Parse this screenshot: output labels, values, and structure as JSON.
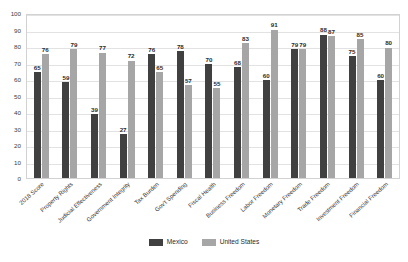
{
  "chart_data": {
    "type": "bar",
    "title": "",
    "subtitle": "",
    "xlabel": "",
    "ylabel": "",
    "ylim": [
      0,
      100
    ],
    "yticks": [
      0,
      10,
      20,
      30,
      40,
      50,
      60,
      70,
      80,
      90,
      100
    ],
    "grid": true,
    "legend_position": "bottom-center",
    "categories": [
      "2018 Score",
      "Property Rights",
      "Judicial Effectiveness",
      "Government Integrity",
      "Tax Burden",
      "Gov't Spending",
      "Fiscal Health",
      "Business Freedom",
      "Labor Freedom",
      "Monetary Freedom",
      "Trade Freedom",
      "Investment Freedom",
      "Financial Freedom"
    ],
    "series": [
      {
        "name": "Mexico",
        "color": "#404040",
        "values": [
          65,
          59,
          39,
          27,
          76,
          78,
          70,
          68,
          60,
          79,
          88,
          75,
          60
        ]
      },
      {
        "name": "United States",
        "color": "#a6a6a6",
        "values": [
          76,
          79,
          77,
          72,
          65,
          57,
          55,
          83,
          91,
          79,
          87,
          85,
          80
        ]
      }
    ]
  },
  "legend": {
    "items": [
      {
        "label": "Mexico",
        "swatch": "mx"
      },
      {
        "label": "United States",
        "swatch": "us"
      }
    ]
  },
  "colors": {
    "mexico": "#404040",
    "united_states": "#a6a6a6",
    "gridline": "#e2e2e2",
    "frame": "#d2d2d2",
    "background": "#ffffff"
  }
}
